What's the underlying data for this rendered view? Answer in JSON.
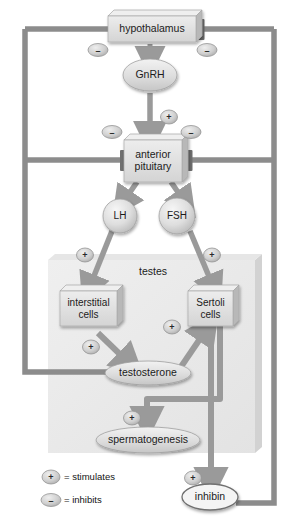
{
  "diagram": {
    "colors": {
      "node_fill": "#dcdcdc",
      "node_fill_light": "#e8e8e8",
      "node_side": "#b4b4b4",
      "node_top": "#efefef",
      "arrow_gray": "#9a9a9a",
      "feedback_line": "#8c8c8c",
      "panel_fill": "#ececec",
      "panel_side": "#d6d6d6",
      "badge_fill": "#c9c9c9",
      "text": "#1b1b1b",
      "outline": "#8f8f8f"
    },
    "nodes": [
      {
        "id": "hypothalamus",
        "label": "hypothalamus",
        "shape": "box3d"
      },
      {
        "id": "gnrh",
        "label": "GnRH",
        "shape": "ellipse"
      },
      {
        "id": "anterior_pituitary",
        "label": "anterior\npituitary",
        "line1": "anterior",
        "line2": "pituitary",
        "shape": "box3d"
      },
      {
        "id": "lh",
        "label": "LH",
        "shape": "circle"
      },
      {
        "id": "fsh",
        "label": "FSH",
        "shape": "circle"
      },
      {
        "id": "testes",
        "label": "testes",
        "shape": "panel"
      },
      {
        "id": "interstitial_cells",
        "label": "interstitial cells",
        "line1": "interstitial",
        "line2": "cells",
        "shape": "box3d"
      },
      {
        "id": "sertoli_cells",
        "label": "Sertoli cells",
        "line1": "Sertoli",
        "line2": "cells",
        "shape": "box3d"
      },
      {
        "id": "testosterone",
        "label": "testosterone",
        "shape": "ellipse"
      },
      {
        "id": "spermatogenesis",
        "label": "spermatogenesis",
        "shape": "ellipse"
      },
      {
        "id": "inhibin",
        "label": "inhibin",
        "shape": "ellipse"
      }
    ],
    "badges": {
      "plus": "+",
      "minus": "–",
      "items": [
        {
          "id": "minus-hypo-left",
          "sign": "–"
        },
        {
          "id": "minus-hypo-right",
          "sign": "–"
        },
        {
          "id": "plus-gnrh-to-pituitary",
          "sign": "+"
        },
        {
          "id": "minus-pituitary-left",
          "sign": "–"
        },
        {
          "id": "minus-pituitary-right",
          "sign": "–"
        },
        {
          "id": "plus-lh-to-interstitial",
          "sign": "+"
        },
        {
          "id": "plus-fsh-to-sertoli",
          "sign": "+"
        },
        {
          "id": "plus-interstitial-to-testosterone",
          "sign": "+"
        },
        {
          "id": "plus-testosterone-to-sertoli",
          "sign": "+"
        },
        {
          "id": "plus-to-spermatogenesis",
          "sign": "+"
        },
        {
          "id": "plus-to-inhibin",
          "sign": "+"
        }
      ]
    },
    "legend": [
      {
        "sign": "+",
        "text": "= stimulates"
      },
      {
        "sign": "–",
        "text": "= inhibits"
      }
    ]
  }
}
